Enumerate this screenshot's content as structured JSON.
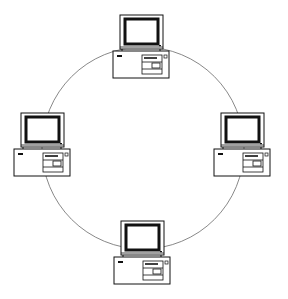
{
  "diagram": {
    "type": "ring-network-topology",
    "title": "",
    "background": "#ffffff",
    "ring": {
      "cx": 143,
      "cy": 148,
      "r": 101,
      "stroke": "#6a6a6a",
      "stroke_width": 0.8
    },
    "node_icon": "desktop-computer-icon",
    "nodes": [
      {
        "id": "computer-top",
        "position": "top",
        "x": 112,
        "y": 14,
        "label": ""
      },
      {
        "id": "computer-left",
        "position": "left",
        "x": 13,
        "y": 112,
        "label": ""
      },
      {
        "id": "computer-right",
        "position": "right",
        "x": 211,
        "y": 112,
        "label": ""
      },
      {
        "id": "computer-bottom",
        "position": "bottom",
        "x": 113,
        "y": 220,
        "label": ""
      }
    ],
    "colors": {
      "line": "#111111",
      "screen_bezel": "#111111",
      "fill": "#ffffff"
    }
  }
}
